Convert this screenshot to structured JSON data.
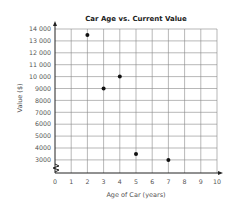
{
  "chart_data": {
    "type": "scatter",
    "title": "Car Age vs. Current Value",
    "xlabel": "Age of Car (years)",
    "ylabel": "Value ($)",
    "x_ticks": [
      "0",
      "1",
      "2",
      "3",
      "4",
      "5",
      "6",
      "7",
      "8",
      "9",
      "10"
    ],
    "y_ticks": [
      "14 000",
      "13 000",
      "12 000",
      "11 000",
      "10 000",
      "9000",
      "8000",
      "7000",
      "6000",
      "5000",
      "4000",
      "3000"
    ],
    "xlim": [
      0,
      10
    ],
    "ylim": [
      2000,
      14000
    ],
    "y_axis_break": true,
    "grid": true,
    "points": [
      {
        "x": 2,
        "y": 13500
      },
      {
        "x": 3,
        "y": 9000
      },
      {
        "x": 4,
        "y": 10000
      },
      {
        "x": 5,
        "y": 3500
      },
      {
        "x": 7,
        "y": 3000
      }
    ]
  }
}
